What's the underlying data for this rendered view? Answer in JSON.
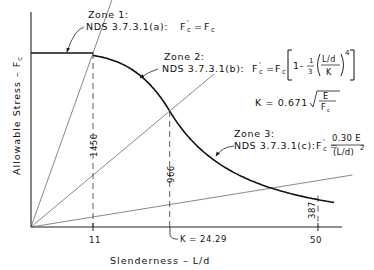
{
  "chart_data": {
    "type": "line",
    "title": "",
    "xlabel": "Slenderness - L/d",
    "ylabel": "Allowable Stress - F'c",
    "xlim": [
      0,
      53
    ],
    "ylim": [
      0,
      2100
    ],
    "grid": false,
    "Fc": 1450,
    "E": 1400000,
    "K": 24.29,
    "x_ticks": [
      {
        "value": 11,
        "label": "11"
      },
      {
        "value": 50,
        "label": "50"
      }
    ],
    "k_marker": {
      "value": 24.29,
      "label": "K = 24.29"
    },
    "value_labels": [
      {
        "x": 11,
        "label": "1450"
      },
      {
        "x": 24.29,
        "label": "966"
      },
      {
        "x": 50,
        "label": "387"
      }
    ],
    "series": [
      {
        "name": "Zone 1 (short)",
        "x": [
          0,
          11
        ],
        "y": [
          1450,
          1450
        ]
      },
      {
        "name": "Zone 2 (intermediate)",
        "x": [
          11,
          14,
          17,
          20,
          22,
          24.29
        ],
        "y": [
          1450,
          1408,
          1322,
          1179,
          1055,
          966
        ]
      },
      {
        "name": "Zone 3 (long)",
        "x": [
          24.29,
          28,
          32,
          36,
          40,
          44,
          48,
          52
        ],
        "y": [
          966,
          536,
          410,
          324,
          262,
          217,
          182,
          155
        ]
      }
    ],
    "radial_lines": [
      {
        "through_x": 11,
        "through_y": 1450
      },
      {
        "through_x": 24.29,
        "through_y": 966
      },
      {
        "through_x": 50,
        "through_y": 387
      }
    ],
    "annotations": {
      "zone1": {
        "title": "Zone 1:",
        "ref": "NDS 3.7.3.1(a):",
        "formula": "F'c = Fc"
      },
      "zone2": {
        "title": "Zone 2:",
        "ref": "NDS 3.7.3.1(b):",
        "formula": "F'c = Fc [1 - 1/3 ((L/d)/K)^4]",
        "k_formula": "K = 0.671 √(E/Fc)"
      },
      "zone3": {
        "title": "Zone 3:",
        "ref": "NDS 3.7.3.1(c):",
        "formula": "F'c = 0.30 E / (L/d)^2"
      }
    }
  },
  "text": {
    "xlabel": "Slenderness  –  L/d",
    "ylabel": "Allowable  Stress  –  F",
    "ylabel_sub": "c",
    "ylabel_prime": "'",
    "tick_11": "11",
    "tick_50": "50",
    "k_label": "K = 24.29",
    "v1450": "1450",
    "v966": "966",
    "v387": "387",
    "z1_title": "Zone 1:",
    "z1_ref": "NDS  3.7.3.1(a):",
    "z2_title": "Zone 2:",
    "z2_ref": "NDS  3.7.3.1(b):",
    "z3_title": "Zone 3:",
    "z3_ref": "NDS  3.7.3.1(c):",
    "F": "F",
    "c": "c",
    "eq": "=",
    "one": "1",
    "minus": "-",
    "third_num": "1",
    "third_den": "3",
    "Ld": "L/d",
    "K": "K",
    "pow4": "4",
    "k_eq": "K  =  0.671",
    "E": "E",
    "z3_num": "0.30 E",
    "z3_den": "(L/d)",
    "pow2": "2"
  }
}
